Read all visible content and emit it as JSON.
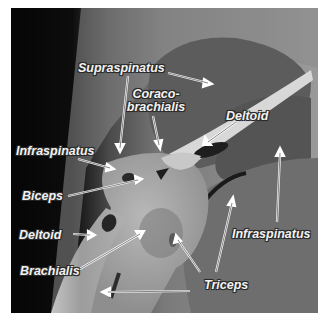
{
  "figure": {
    "labels": [
      {
        "id": "supraspinatus",
        "text": "Supraspinatus"
      },
      {
        "id": "coracobrachialis",
        "line1": "Coraco-",
        "line2": "brachialis"
      },
      {
        "id": "deltoid_upper",
        "text": "Deltoid"
      },
      {
        "id": "infraspinatus_left",
        "text": "Infraspinatus"
      },
      {
        "id": "biceps",
        "text": "Biceps"
      },
      {
        "id": "deltoid_lower",
        "text": "Deltoid"
      },
      {
        "id": "brachialis",
        "text": "Brachialis"
      },
      {
        "id": "triceps",
        "text": "Triceps"
      },
      {
        "id": "infraspinatus_right",
        "text": "Infraspinatus"
      }
    ]
  }
}
